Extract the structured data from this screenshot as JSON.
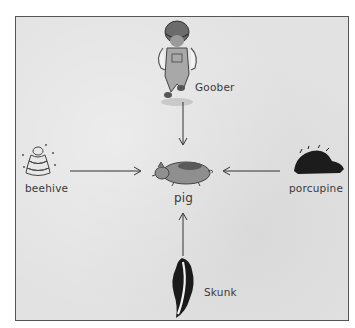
{
  "diagram": {
    "center": {
      "label": "pig",
      "icon": "pig-icon"
    },
    "nodes": [
      {
        "id": "goober",
        "label": "Goober",
        "icon": "farmer-icon",
        "position": "top",
        "arrow_to": "pig"
      },
      {
        "id": "beehive",
        "label": "beehive",
        "icon": "beehive-icon",
        "position": "left",
        "arrow_to": "pig"
      },
      {
        "id": "porcupine",
        "label": "porcupine",
        "icon": "porcupine-icon",
        "position": "right",
        "arrow_to": "pig"
      },
      {
        "id": "skunk",
        "label": "Skunk",
        "icon": "skunk-icon",
        "position": "bottom",
        "arrow_to": "pig"
      }
    ],
    "colors": {
      "background": "#e2e2e2",
      "border": "#555555",
      "ink": "#3a3a3a"
    }
  }
}
